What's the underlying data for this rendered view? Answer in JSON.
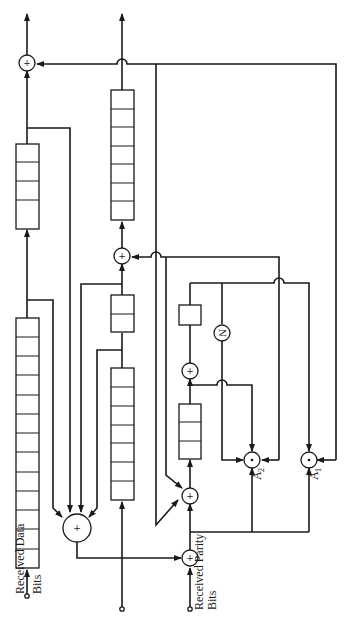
{
  "diagram": {
    "labels": {
      "received_data_line1": "Received Data",
      "received_data_line2": "Bits",
      "received_parity_line1": "Received Parity",
      "received_parity_line2": "Bits",
      "and_gate_a1": "A",
      "and_gate_a1_sub": "1",
      "and_gate_a2": "A",
      "and_gate_a2_sub": "2",
      "xor_symbol": "+",
      "and_symbol": "·",
      "inverter_symbol": "N"
    },
    "shift_registers": [
      {
        "id": "data-register-long",
        "cells": 13
      },
      {
        "id": "data-register-output",
        "cells": 4
      },
      {
        "id": "middle-register-output",
        "cells": 7
      },
      {
        "id": "middle-register-mid",
        "cells": 2
      },
      {
        "id": "middle-register-input",
        "cells": 7
      },
      {
        "id": "parity-register",
        "cells": 3
      },
      {
        "id": "parity-delay",
        "cells": 1
      }
    ],
    "gates": [
      {
        "id": "xor-data-output",
        "type": "xor"
      },
      {
        "id": "xor-middle-output",
        "type": "xor"
      },
      {
        "id": "xor-syndrome-big",
        "type": "xor"
      },
      {
        "id": "xor-parity-input",
        "type": "xor"
      },
      {
        "id": "xor-parity-feedback",
        "type": "xor"
      },
      {
        "id": "xor-parity-delay",
        "type": "xor"
      },
      {
        "id": "inverter-n",
        "type": "not"
      },
      {
        "id": "and-a2",
        "type": "and"
      },
      {
        "id": "and-a1",
        "type": "and"
      }
    ],
    "inputs": [
      {
        "id": "input-data-bits"
      },
      {
        "id": "input-middle"
      },
      {
        "id": "input-parity-bits"
      }
    ],
    "outputs": [
      {
        "id": "output-data"
      },
      {
        "id": "output-middle"
      }
    ]
  }
}
